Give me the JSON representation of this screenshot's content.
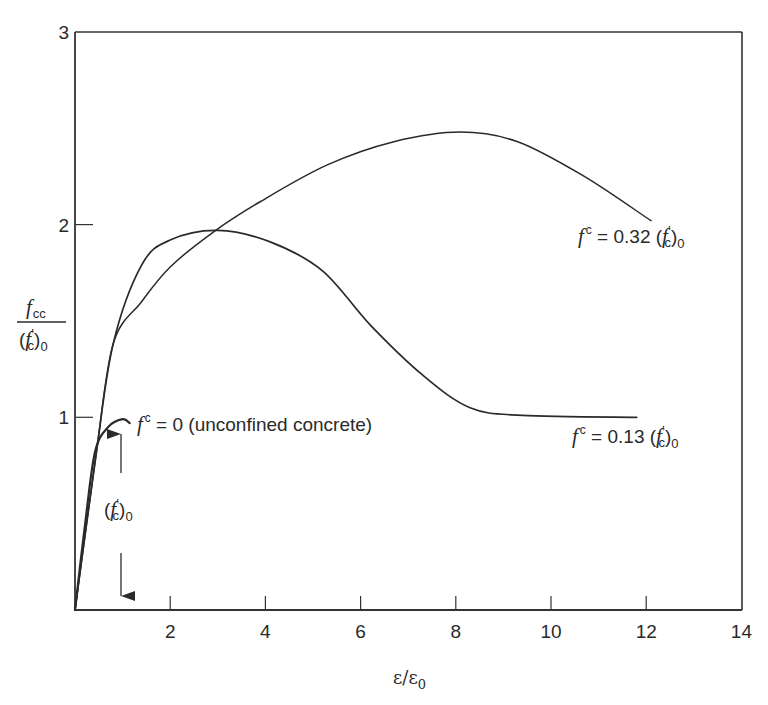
{
  "chart_data": {
    "type": "line",
    "title": "",
    "xlabel": "ε/ε0",
    "ylabel": "f_cc / (f'_c)_0",
    "xlim": [
      0,
      14
    ],
    "ylim": [
      0,
      3
    ],
    "grid": false,
    "x_ticks": [
      2,
      4,
      6,
      8,
      10,
      12,
      14
    ],
    "y_ticks": [
      1,
      2,
      3
    ],
    "series": [
      {
        "name": "f^c = 0 (unconfined concrete)",
        "x": [
          0,
          0.2,
          0.42,
          0.7,
          1.0,
          1.15
        ],
        "y": [
          0,
          0.42,
          0.82,
          0.95,
          0.99,
          0.97
        ]
      },
      {
        "name": "f^c = 0.13 (f'_c)_0",
        "x": [
          0,
          0.44,
          0.8,
          1.4,
          2.0,
          3.0,
          4.1,
          5.2,
          6.2,
          7.3,
          8.3,
          9.4,
          11.8
        ],
        "y": [
          0,
          0.8,
          1.38,
          1.79,
          1.92,
          1.97,
          1.91,
          1.76,
          1.48,
          1.22,
          1.05,
          1.01,
          1.0
        ]
      },
      {
        "name": "f^c = 0.32 (f'_c)_0",
        "x": [
          0,
          0.44,
          0.8,
          1.4,
          2.0,
          2.9,
          3.9,
          5.3,
          6.7,
          8.1,
          9.3,
          10.7,
          12.1
        ],
        "y": [
          0,
          0.8,
          1.38,
          1.6,
          1.78,
          1.96,
          2.12,
          2.31,
          2.43,
          2.48,
          2.43,
          2.25,
          2.02
        ]
      }
    ],
    "annotations": [
      {
        "text": "f^c = 0 (unconfined concrete)",
        "x": 1.3,
        "y": 0.98
      },
      {
        "text": "f^c = 0.13 (f'_c)_0",
        "x": 10.5,
        "y": 0.93
      },
      {
        "text": "f^c = 0.32 (f'_c)_0",
        "x": 10.7,
        "y": 1.9
      },
      {
        "text": "(f'_c)_0",
        "x": 1.0,
        "y": 0.5,
        "note": "double arrow from 0 to 1 at x=1"
      }
    ]
  },
  "labels": {
    "y_ticks": [
      "1",
      "2",
      "3"
    ],
    "x_ticks": [
      "2",
      "4",
      "6",
      "8",
      "10",
      "12",
      "14"
    ],
    "xlabel_eps": "ε/ε",
    "xlabel_sub": "0",
    "ylabel_num_main": "f",
    "ylabel_num_sub": "cc",
    "ylabel_den_open": "(",
    "ylabel_den_f": "f",
    "ylabel_den_prime": "′",
    "ylabel_den_sub": "c",
    "ylabel_den_close": ")",
    "ylabel_den_sub0": "0",
    "unconf_f": "f",
    "unconf_sup": "c",
    "unconf_rest": " = 0 (unconfined concrete)",
    "c013_f": "f",
    "c013_sup": "c",
    "c013_rest": " = 0.13 (",
    "c032_f": "f",
    "c032_sup": "c",
    "c032_rest": " = 0.32 (",
    "fc_f": "f",
    "fc_prime": "′",
    "fc_sub": "c",
    "fc_close": ")",
    "fc_sub0": "0",
    "arrow_open": "("
  }
}
